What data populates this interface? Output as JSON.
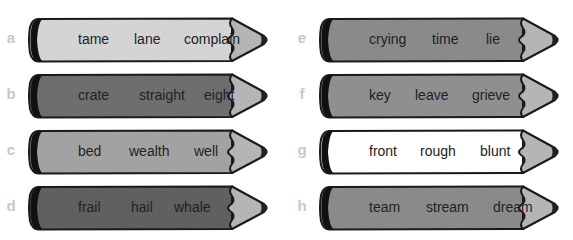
{
  "pencils": [
    {
      "label": "a",
      "color": "#d4d4d4",
      "words": [
        "tame",
        "lane",
        "complain"
      ],
      "offsets": [
        9,
        65,
        115
      ]
    },
    {
      "label": "b",
      "color": "#6e6e6e",
      "words": [
        "crate",
        "straight",
        "eight"
      ],
      "offsets": [
        9,
        70,
        135
      ]
    },
    {
      "label": "c",
      "color": "#a2a2a2",
      "words": [
        "bed",
        "wealth",
        "well"
      ],
      "offsets": [
        9,
        60,
        125
      ]
    },
    {
      "label": "d",
      "color": "#606060",
      "words": [
        "frail",
        "hail",
        "whale"
      ],
      "offsets": [
        9,
        62,
        105
      ]
    },
    {
      "label": "e",
      "color": "#8a8a8a",
      "words": [
        "crying",
        "time",
        "lie"
      ],
      "offsets": [
        9,
        72,
        126
      ]
    },
    {
      "label": "f",
      "color": "#8f8f8f",
      "words": [
        "key",
        "leave",
        "grieve"
      ],
      "offsets": [
        9,
        55,
        112
      ]
    },
    {
      "label": "g",
      "color": "#ffffff",
      "words": [
        "front",
        "rough",
        "blunt"
      ],
      "offsets": [
        9,
        60,
        120
      ]
    },
    {
      "label": "h",
      "color": "#8a8a8a",
      "words": [
        "team",
        "stream",
        "dream"
      ],
      "offsets": [
        9,
        66,
        133
      ]
    }
  ],
  "colors": {
    "tip": "#b5b5b5",
    "lead": "#222222",
    "outline": "#1a1a1a",
    "band": "#111111",
    "label": "#c8c8c8"
  }
}
